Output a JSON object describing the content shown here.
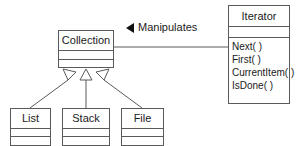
{
  "diagram": {
    "background_color": "#ffffff",
    "line_color": "#5a5a5a",
    "text_color": "#1a1a1a",
    "arrow_color": "#111111"
  },
  "classes": {
    "iterator": {
      "name": "Iterator",
      "attributes": [],
      "operations": [
        "Next( )",
        "First( )",
        "CurrentItem( )",
        "IsDone( )"
      ]
    },
    "collection": {
      "name": "Collection",
      "attributes": [],
      "operations": []
    },
    "list": {
      "name": "List",
      "attributes": [],
      "operations": []
    },
    "stack": {
      "name": "Stack",
      "attributes": [],
      "operations": []
    },
    "file": {
      "name": "File",
      "attributes": [],
      "operations": []
    }
  },
  "associations": {
    "manipulates": {
      "label": "Manipulates",
      "direction_icon": "solid-left-triangle-icon",
      "from": "Iterator",
      "to": "Collection"
    }
  },
  "generalizations": [
    {
      "child": "List",
      "parent": "Collection",
      "marker": "hollow-triangle-icon"
    },
    {
      "child": "Stack",
      "parent": "Collection",
      "marker": "hollow-triangle-icon"
    },
    {
      "child": "File",
      "parent": "Collection",
      "marker": "hollow-triangle-icon"
    }
  ]
}
